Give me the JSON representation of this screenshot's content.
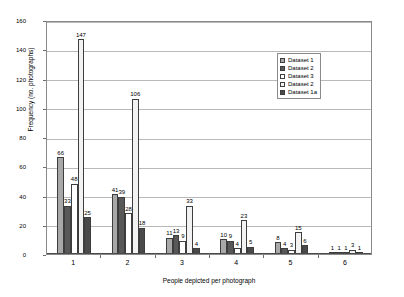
{
  "chart_data": {
    "type": "bar",
    "title": "",
    "xlabel": "People depicted per photograph",
    "ylabel": "Frequency (no. photographs)",
    "categories": [
      "1",
      "2",
      "3",
      "4",
      "5",
      "6"
    ],
    "ylim": [
      0,
      160
    ],
    "yticks": [
      0,
      20,
      40,
      60,
      80,
      100,
      120,
      140,
      160
    ],
    "grid": true,
    "legend_position": "top-right-inside",
    "series": [
      {
        "name": "Dataset 1",
        "color": "#a8a8a8",
        "values": [
          66,
          41,
          11,
          10,
          8,
          1
        ]
      },
      {
        "name": "Dataset 2",
        "color": "#585858",
        "values": [
          33,
          39,
          13,
          9,
          4,
          1
        ]
      },
      {
        "name": "Dataset 3",
        "color": "#ffffff",
        "values": [
          48,
          28,
          9,
          4,
          3,
          1
        ]
      },
      {
        "name": "Dataset 2",
        "color": "#f2f2f2",
        "values": [
          147,
          106,
          33,
          23,
          15,
          3
        ]
      },
      {
        "name": "Dataset 1a",
        "color": "#4a4a4a",
        "values": [
          25,
          18,
          4,
          5,
          6,
          1
        ]
      }
    ]
  }
}
